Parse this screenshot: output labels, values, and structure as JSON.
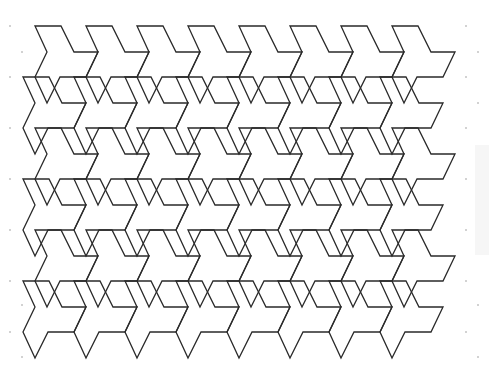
{
  "figure": {
    "title": "",
    "stroke_color": "#2a2a2a",
    "background_color": "#ffffff",
    "dot_color": "#9a9a9a",
    "panel_color": "#f6f6f6"
  },
  "tiling": {
    "origin": [
      35,
      26
    ],
    "lattice_a": [
      51,
      0
    ],
    "lattice_b": [
      -12,
      51
    ],
    "columns": 8,
    "rows": 6,
    "tile_outline": [
      [
        0,
        0
      ],
      [
        26,
        0
      ],
      [
        39,
        26
      ],
      [
        63,
        26
      ],
      [
        51,
        51
      ],
      [
        25,
        51
      ],
      [
        12,
        77
      ],
      [
        0,
        51
      ],
      [
        12,
        26
      ]
    ]
  },
  "dot_grid": {
    "left_column_x": 10,
    "left_column_y": [
      26,
      77,
      128,
      179,
      230,
      281,
      332
    ],
    "inner_left_x": 22,
    "inner_left_y": [
      52,
      305,
      357
    ],
    "right_column_x": 466,
    "right_column_y": [
      26,
      77,
      128,
      179,
      230,
      281,
      332
    ],
    "outer_right_x": 478,
    "outer_right_y": [
      52,
      103,
      305,
      357
    ]
  }
}
